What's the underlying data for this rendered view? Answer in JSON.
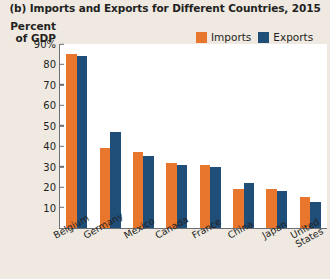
{
  "chart_data": {
    "type": "bar",
    "title": "(b) Imports and Exports for Different Countries, 2015",
    "ylabel": "Percent of GDP",
    "xlabel": "",
    "ylim": [
      0,
      90
    ],
    "yticks": [
      "90%",
      "80",
      "70",
      "60",
      "50",
      "40",
      "30",
      "20",
      "10"
    ],
    "ytick_values": [
      90,
      80,
      70,
      60,
      50,
      40,
      30,
      20,
      10
    ],
    "grid": false,
    "legend_position": "top-right",
    "categories": [
      "Belgium",
      "Germany",
      "Mexico",
      "Canada",
      "France",
      "China",
      "Japan",
      "United States"
    ],
    "series": [
      {
        "name": "Imports",
        "color": "#E8762C",
        "values": [
          85,
          39,
          37,
          32,
          31,
          19,
          19,
          15
        ]
      },
      {
        "name": "Exports",
        "color": "#1F4E79",
        "values": [
          84,
          47,
          35,
          31,
          30,
          22,
          18,
          12.5
        ]
      }
    ]
  },
  "colors": {
    "imports": "#E8762C",
    "exports": "#1F4E79",
    "page_background": "#efe9e2",
    "plot_background": "#ffffff",
    "axis": "#6d6e71",
    "text": "#231f20"
  }
}
